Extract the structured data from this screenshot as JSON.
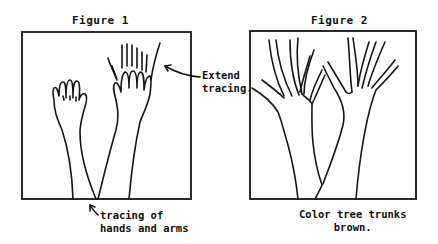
{
  "figures": [
    {
      "title": "Figure 1",
      "subject": "hand-and-arm tracings",
      "annotations": {
        "extend": {
          "line1": "Extend",
          "line2": "tracing."
        },
        "tracing": {
          "line1": "tracing of",
          "line2": "hands and arms"
        }
      }
    },
    {
      "title": "Figure 2",
      "subject": "tracings extended into trees",
      "caption": {
        "line1": "Color tree trunks",
        "line2": "brown."
      }
    }
  ],
  "colors": {
    "ink": "#151515",
    "paper": "#ffffff"
  },
  "icons": {
    "arrow_extend": "arrow-icon",
    "arrow_tracing": "arrow-icon"
  }
}
